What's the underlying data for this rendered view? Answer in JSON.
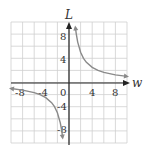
{
  "chart_data": {
    "type": "line",
    "title": "",
    "xlabel": "w",
    "ylabel": "L",
    "xlim": [
      -10,
      10
    ],
    "ylim": [
      -10,
      10
    ],
    "grid": true,
    "grid_step": 2,
    "x_ticks": [
      "-8",
      "-4",
      "0",
      "4",
      "8"
    ],
    "y_ticks": [
      "8",
      "4",
      "-4",
      "-8"
    ],
    "series": [
      {
        "name": "L = 10/w (w > 0)",
        "x": [
          1.1,
          1.25,
          1.5,
          2,
          2.5,
          3,
          4,
          5,
          6,
          8,
          10
        ],
        "y": [
          9.1,
          8,
          6.67,
          5,
          4,
          3.33,
          2.5,
          2,
          1.67,
          1.25,
          1
        ]
      },
      {
        "name": "L = 10/w (w < 0)",
        "x": [
          -10,
          -8,
          -6,
          -5,
          -4,
          -3,
          -2.5,
          -2,
          -1.5,
          -1.25,
          -1.1
        ],
        "y": [
          -1,
          -1.25,
          -1.67,
          -2,
          -2.5,
          -3.33,
          -4,
          -5,
          -6.67,
          -8,
          -9.1
        ]
      }
    ],
    "colors": {
      "curve": "#8a8a8a",
      "axis": "#222222",
      "grid": "#cfcfcf"
    }
  },
  "labels": {
    "x_axis": "w",
    "y_axis": "L",
    "xt_m8": "-8",
    "xt_m4": "-4",
    "xt_0": "0",
    "xt_4": "4",
    "xt_8": "8",
    "yt_8": "8",
    "yt_4": "4",
    "yt_m4": "-4",
    "yt_m8": "-8"
  }
}
